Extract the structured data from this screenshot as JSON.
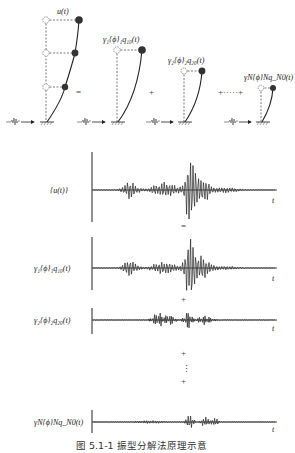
{
  "figure": {
    "caption": "图 5.1-1   振型分解法原理示意",
    "top_row": {
      "frames": [
        {
          "label": "u(t)"
        },
        {
          "label": "γ₁{ϕ}₁q₁₀(t)"
        },
        {
          "label": "γ₂{ϕ}₂q₂₀(t)"
        },
        {
          "label": "γN{ϕ}Nq_N0(t)"
        }
      ],
      "operators": [
        "=",
        "+",
        "+·····+"
      ]
    },
    "time_histories": [
      {
        "label": "{u(t)}",
        "axis": "t"
      },
      {
        "label": "γ₁{ϕ}₁q₁₀(t)",
        "axis": "t"
      },
      {
        "label": "γ₂{ϕ}₂q₂₀(t)",
        "axis": "t"
      },
      {
        "label": "γN{ϕ}Nq_N0(t)",
        "axis": "t"
      }
    ],
    "between_ops": [
      "=",
      "+",
      "+",
      "⋮",
      "+"
    ]
  }
}
